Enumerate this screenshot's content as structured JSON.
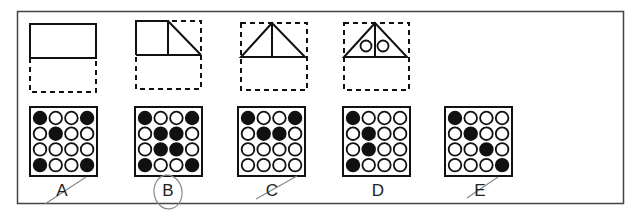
{
  "puzzle": {
    "top_row": [
      {
        "id": "fig-1",
        "shape": "rectangle",
        "description": "solid rectangle on top half of dashed box"
      },
      {
        "id": "fig-2",
        "shape": "square-plus-right-triangle",
        "description": "square with right triangle on top half of dashed box"
      },
      {
        "id": "fig-3",
        "shape": "triangle-with-median",
        "description": "isosceles triangle with vertical center line"
      },
      {
        "id": "fig-4",
        "shape": "triangle-with-median-and-two-circles",
        "description": "isosceles triangle with vertical line and two small circles"
      }
    ],
    "options": [
      {
        "label": "A",
        "grid": [
          [
            1,
            0,
            0,
            1
          ],
          [
            0,
            1,
            0,
            0
          ],
          [
            0,
            0,
            0,
            0
          ],
          [
            1,
            0,
            0,
            1
          ]
        ],
        "struck": true,
        "circled": false
      },
      {
        "label": "B",
        "grid": [
          [
            1,
            0,
            0,
            1
          ],
          [
            0,
            1,
            1,
            0
          ],
          [
            0,
            1,
            1,
            0
          ],
          [
            1,
            0,
            0,
            1
          ]
        ],
        "struck": false,
        "circled": true
      },
      {
        "label": "C",
        "grid": [
          [
            1,
            0,
            0,
            1
          ],
          [
            0,
            1,
            1,
            0
          ],
          [
            0,
            0,
            0,
            0
          ],
          [
            0,
            0,
            0,
            0
          ]
        ],
        "struck": true,
        "circled": false
      },
      {
        "label": "D",
        "grid": [
          [
            1,
            0,
            0,
            0
          ],
          [
            0,
            1,
            0,
            0
          ],
          [
            0,
            1,
            0,
            0
          ],
          [
            1,
            0,
            0,
            0
          ]
        ],
        "struck": false,
        "circled": false
      },
      {
        "label": "E",
        "grid": [
          [
            1,
            0,
            0,
            0
          ],
          [
            0,
            1,
            0,
            0
          ],
          [
            0,
            0,
            1,
            0
          ],
          [
            0,
            0,
            0,
            1
          ]
        ],
        "struck": true,
        "circled": false
      }
    ]
  },
  "colors": {
    "ink": "#111111",
    "frame": "#444444",
    "pencil": "#888888"
  }
}
